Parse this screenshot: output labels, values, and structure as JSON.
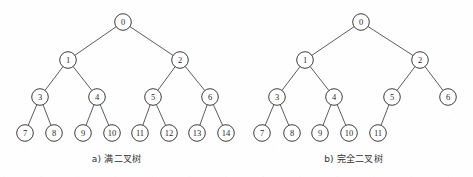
{
  "figure": {
    "background_color": "#fefefe",
    "node_stroke_color": "#3d3d3d",
    "edge_stroke_color": "#4a4a4a",
    "label_color": "#2a2a2a",
    "node_radius": 8.3,
    "width": 473,
    "height": 177
  },
  "diagram_data": {
    "type": "diagram",
    "subtype": "binary-tree",
    "panels": [
      {
        "id": "panel-a",
        "caption": "a) 满二叉树",
        "caption_center_x": 116,
        "caption_y": 152,
        "description": "Full binary tree with 15 nodes labeled 0 through 14",
        "node_count": 15,
        "depth": 4,
        "nodes": [
          {
            "label": "0",
            "x": 123,
            "y": 22,
            "level": 0,
            "parent": null
          },
          {
            "label": "1",
            "x": 68,
            "y": 60,
            "level": 1,
            "parent": "0"
          },
          {
            "label": "2",
            "x": 180,
            "y": 60,
            "level": 1,
            "parent": "0"
          },
          {
            "label": "3",
            "x": 40,
            "y": 97,
            "level": 2,
            "parent": "1"
          },
          {
            "label": "4",
            "x": 97,
            "y": 97,
            "level": 2,
            "parent": "1"
          },
          {
            "label": "5",
            "x": 153,
            "y": 97,
            "level": 2,
            "parent": "2"
          },
          {
            "label": "6",
            "x": 210,
            "y": 97,
            "level": 2,
            "parent": "2"
          },
          {
            "label": "7",
            "x": 25,
            "y": 133,
            "level": 3,
            "parent": "3"
          },
          {
            "label": "8",
            "x": 54,
            "y": 133,
            "level": 3,
            "parent": "3"
          },
          {
            "label": "9",
            "x": 83,
            "y": 133,
            "level": 3,
            "parent": "4"
          },
          {
            "label": "10",
            "x": 112,
            "y": 133,
            "level": 3,
            "parent": "4"
          },
          {
            "label": "11",
            "x": 140,
            "y": 133,
            "level": 3,
            "parent": "5"
          },
          {
            "label": "12",
            "x": 169,
            "y": 133,
            "level": 3,
            "parent": "5"
          },
          {
            "label": "13",
            "x": 197,
            "y": 133,
            "level": 3,
            "parent": "6"
          },
          {
            "label": "14",
            "x": 226,
            "y": 133,
            "level": 3,
            "parent": "6"
          }
        ],
        "edges": [
          {
            "from": "0",
            "to": "1"
          },
          {
            "from": "0",
            "to": "2"
          },
          {
            "from": "1",
            "to": "3"
          },
          {
            "from": "1",
            "to": "4"
          },
          {
            "from": "2",
            "to": "5"
          },
          {
            "from": "2",
            "to": "6"
          },
          {
            "from": "3",
            "to": "7"
          },
          {
            "from": "3",
            "to": "8"
          },
          {
            "from": "4",
            "to": "9"
          },
          {
            "from": "4",
            "to": "10"
          },
          {
            "from": "5",
            "to": "11"
          },
          {
            "from": "5",
            "to": "12"
          },
          {
            "from": "6",
            "to": "13"
          },
          {
            "from": "6",
            "to": "14"
          }
        ]
      },
      {
        "id": "panel-b",
        "caption": "b) 完全二叉树",
        "caption_center_x": 354,
        "caption_y": 152,
        "description": "Complete binary tree with 12 nodes labeled 0 through 11",
        "node_count": 12,
        "depth": 4,
        "nodes": [
          {
            "label": "0",
            "x": 361,
            "y": 22,
            "level": 0,
            "parent": null
          },
          {
            "label": "1",
            "x": 305,
            "y": 60,
            "level": 1,
            "parent": "0"
          },
          {
            "label": "2",
            "x": 420,
            "y": 60,
            "level": 1,
            "parent": "0"
          },
          {
            "label": "3",
            "x": 277,
            "y": 97,
            "level": 2,
            "parent": "1"
          },
          {
            "label": "4",
            "x": 334,
            "y": 97,
            "level": 2,
            "parent": "1"
          },
          {
            "label": "5",
            "x": 392,
            "y": 97,
            "level": 2,
            "parent": "2"
          },
          {
            "label": "6",
            "x": 448,
            "y": 97,
            "level": 2,
            "parent": "2"
          },
          {
            "label": "7",
            "x": 262,
            "y": 133,
            "level": 3,
            "parent": "3"
          },
          {
            "label": "8",
            "x": 292,
            "y": 133,
            "level": 3,
            "parent": "3"
          },
          {
            "label": "9",
            "x": 320,
            "y": 133,
            "level": 3,
            "parent": "4"
          },
          {
            "label": "10",
            "x": 349,
            "y": 133,
            "level": 3,
            "parent": "4"
          },
          {
            "label": "11",
            "x": 378,
            "y": 133,
            "level": 3,
            "parent": "5"
          }
        ],
        "edges": [
          {
            "from": "0",
            "to": "1"
          },
          {
            "from": "0",
            "to": "2"
          },
          {
            "from": "1",
            "to": "3"
          },
          {
            "from": "1",
            "to": "4"
          },
          {
            "from": "2",
            "to": "5"
          },
          {
            "from": "2",
            "to": "6"
          },
          {
            "from": "3",
            "to": "7"
          },
          {
            "from": "3",
            "to": "8"
          },
          {
            "from": "4",
            "to": "9"
          },
          {
            "from": "4",
            "to": "10"
          },
          {
            "from": "5",
            "to": "11"
          }
        ]
      }
    ]
  }
}
